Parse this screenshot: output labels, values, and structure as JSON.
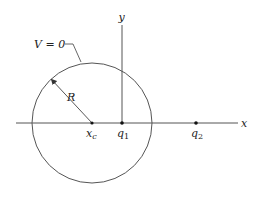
{
  "diagram": {
    "type": "electrostatics-image-charge",
    "labels": {
      "potential": "V = 0",
      "radius": "R",
      "x_axis": "x",
      "y_axis": "y",
      "center": "x",
      "center_sub": "c",
      "q1": "q",
      "q1_sub": "1",
      "q2": "q",
      "q2_sub": "2"
    },
    "geometry": {
      "circle": {
        "cx": 92,
        "cy": 123,
        "r": 60
      },
      "x_axis": {
        "x1": 16,
        "x2": 238,
        "y": 123
      },
      "y_axis": {
        "x": 122,
        "y1": 25,
        "y2": 123
      },
      "points": [
        {
          "name": "x_c",
          "x": 92,
          "y": 123
        },
        {
          "name": "q_1",
          "x": 122,
          "y": 123
        },
        {
          "name": "q_2",
          "x": 196,
          "y": 123
        }
      ]
    },
    "colors": {
      "line": "#555555",
      "text": "#222222",
      "background": "#ffffff"
    }
  }
}
